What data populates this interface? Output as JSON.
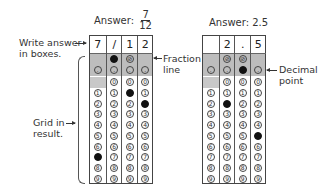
{
  "labels": {
    "write_answer_line1": "Write answer",
    "write_answer_line2": "in boxes.",
    "grid_in_line1": "Grid in",
    "grid_in_line2": "result.",
    "fraction_line_line1": "Fraction",
    "fraction_line_line2": "line",
    "decimal_point_line1": "Decimal",
    "decimal_point_line2": "point"
  },
  "grids": [
    {
      "title_prefix": "Answer:",
      "title_fraction": {
        "numerator": "7",
        "denominator": "12"
      },
      "title_value": "",
      "boxes": [
        "7",
        "/",
        "1",
        "2"
      ],
      "slash_cols": [
        1,
        2
      ],
      "filled": {
        "slash": [
          1
        ],
        "decimal": [],
        "digits": {
          "0": 7,
          "2": 1,
          "3": 2
        }
      }
    },
    {
      "title_prefix": "Answer: 2.5",
      "title_fraction": null,
      "boxes": [
        "",
        "2",
        ".",
        "5"
      ],
      "slash_cols": [
        1,
        2
      ],
      "filled": {
        "slash": [],
        "decimal": [
          2
        ],
        "digits": {
          "1": 2,
          "3": 5
        }
      }
    }
  ],
  "digits": [
    "0",
    "1",
    "2",
    "3",
    "4",
    "5",
    "6",
    "7",
    "8",
    "9"
  ],
  "slash_symbol": "⊘",
  "decimal_symbol": "."
}
